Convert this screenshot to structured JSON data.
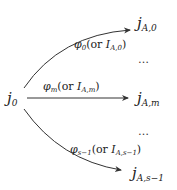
{
  "diagram": {
    "source": {
      "base": "j",
      "sub": "0"
    },
    "targets": [
      {
        "base": "j",
        "sub": "A,0"
      },
      {
        "base": "j",
        "sub": "A,m"
      },
      {
        "base": "j",
        "sub": "A,s−1"
      }
    ],
    "edges": [
      {
        "phi": "φ",
        "phi_sub": "0",
        "or": "(or ",
        "I": "I",
        "I_sub": "A,0",
        "close": ")"
      },
      {
        "phi": "φ",
        "phi_sub": "m",
        "or": "(or ",
        "I": "I",
        "I_sub": "A,m",
        "close": ")"
      },
      {
        "phi": "φ",
        "phi_sub": "s−1",
        "or": "(or ",
        "I": "I",
        "I_sub": "A,s−1",
        "close": ")"
      }
    ],
    "ellipses": [
      "…",
      "…"
    ],
    "colors": {
      "stroke": "#333333",
      "text": "#222222"
    }
  }
}
